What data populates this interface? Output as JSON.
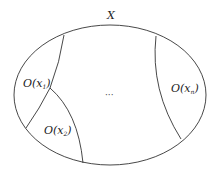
{
  "diagram": {
    "title": "X",
    "set_label": "X",
    "regions": [
      {
        "id": "O1",
        "prefix": "O(",
        "var": "x",
        "sub": "1",
        "suffix": ")"
      },
      {
        "id": "O2",
        "prefix": "O(",
        "var": "x",
        "sub": "2",
        "suffix": ")"
      },
      {
        "id": "On",
        "prefix": "O(",
        "var": "x",
        "sub": "n",
        "suffix": ")"
      }
    ],
    "ellipsis": "···",
    "colors": {
      "stroke": "#333333",
      "background": "#ffffff",
      "text": "#222222"
    }
  }
}
